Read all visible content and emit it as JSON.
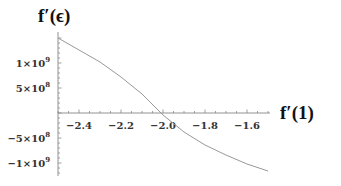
{
  "chart_data": {
    "type": "line",
    "title": "",
    "xlabel": "f'(1)",
    "ylabel": "f'(ε)",
    "xlim": [
      -2.5,
      -1.5
    ],
    "ylim": [
      -1250000000.0,
      1500000000.0
    ],
    "grid": false,
    "legend": null,
    "x_ticks": [
      -2.4,
      -2.2,
      -2.0,
      -1.8,
      -1.6
    ],
    "x_tick_labels": [
      "−2.4",
      "−2.2",
      "−2.0",
      "−1.8",
      "−1.6"
    ],
    "y_ticks": [
      1000000000.0,
      500000000.0,
      -500000000.0,
      -1000000000.0
    ],
    "y_tick_labels": [
      {
        "mant": "1",
        "exp": "9",
        "neg": false
      },
      {
        "mant": "5",
        "exp": "8",
        "neg": false
      },
      {
        "mant": "5",
        "exp": "8",
        "neg": true
      },
      {
        "mant": "1",
        "exp": "9",
        "neg": true
      }
    ],
    "series": [
      {
        "name": "f'(ε)",
        "color": "#999999",
        "x": [
          -2.5,
          -2.4,
          -2.3,
          -2.2,
          -2.1,
          -2.0,
          -1.9,
          -1.8,
          -1.7,
          -1.6,
          -1.5
        ],
        "values": [
          1500000000.0,
          1260000000.0,
          1020000000.0,
          720000000.0,
          380000000.0,
          -40000000.0,
          -380000000.0,
          -640000000.0,
          -840000000.0,
          -1020000000.0,
          -1160000000.0
        ]
      }
    ]
  },
  "labels": {
    "y_axis_title": "f′(ϵ)",
    "x_axis_title": "f′(1)"
  }
}
